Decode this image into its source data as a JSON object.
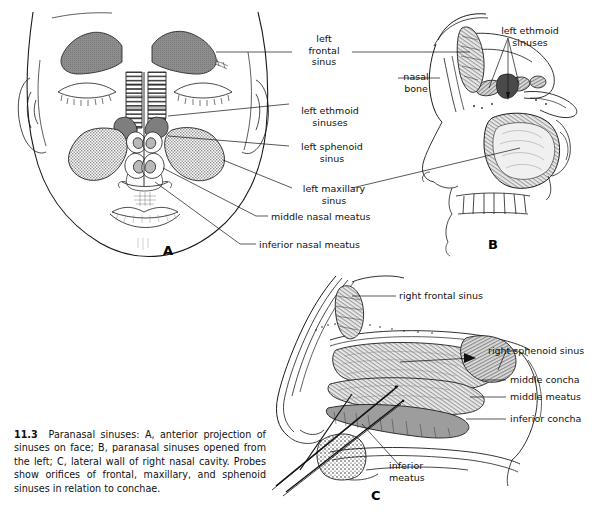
{
  "figure": {
    "number": "11.3",
    "caption": "Paranasal sinuses: A, anterior projection of sinuses on face; B, paranasal sinuses opened from the left; C, lateral wall of right nasal cavity. Probes show orifices of frontal, maxillary, and sphenoid sinuses in relation to conchae."
  },
  "panels": [
    {
      "id": "A",
      "letter": "A",
      "title": "anterior projection of sinuses on face"
    },
    {
      "id": "B",
      "letter": "B",
      "title": "paranasal sinuses opened from the left"
    },
    {
      "id": "C",
      "letter": "C",
      "title": "lateral wall of right nasal cavity"
    }
  ],
  "labels": {
    "panel_a": [
      {
        "name": "left-frontal-sinus",
        "line1": "left",
        "line2": "frontal",
        "line3": "sinus"
      },
      {
        "name": "left-ethmoid-sinuses",
        "line1": "left ethmoid",
        "line2": "sinuses"
      },
      {
        "name": "left-sphenoid-sinus",
        "line1": "left sphenoid",
        "line2": "sinus"
      },
      {
        "name": "left-maxillary-sinus",
        "line1": "left maxillary",
        "line2": "sinus"
      },
      {
        "name": "middle-nasal-meatus",
        "line1": "middle nasal meatus"
      },
      {
        "name": "inferior-nasal-meatus",
        "line1": "inferior nasal meatus"
      }
    ],
    "panel_b": [
      {
        "name": "left-ethmoid-sinuses",
        "line1": "left ethmoid",
        "line2": "sinuses"
      },
      {
        "name": "nasal-bone",
        "line1": "nasal",
        "line2": "bone"
      }
    ],
    "panel_c": [
      {
        "name": "right-frontal-sinus",
        "line1": "right frontal sinus"
      },
      {
        "name": "right-sphenoid-sinus",
        "line1": "right sphenoid sinus"
      },
      {
        "name": "middle-concha",
        "line1": "middle concha"
      },
      {
        "name": "middle-meatus",
        "line1": "middle meatus"
      },
      {
        "name": "inferior-concha",
        "line1": "inferior concha"
      },
      {
        "name": "inferior-meatus",
        "line1": "inferior",
        "line2": "meatus"
      }
    ]
  },
  "colors": {
    "background": "#ffffff",
    "ink": "#1a1a1a",
    "frontal_sinus_fill": "#8d8d8d",
    "maxillary_stipple": "#9b9b9b",
    "ethmoid_stripe": "#4a4a4a",
    "bone_tone": "#b6b6b6"
  }
}
